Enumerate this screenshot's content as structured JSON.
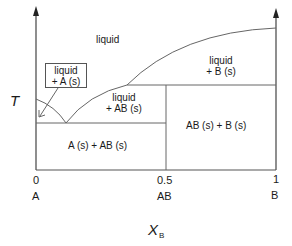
{
  "diagram": {
    "type": "binary phase diagram with congruently melting compound",
    "axes": {
      "y_label": "T",
      "x_label": "X",
      "x_label_sub": "B",
      "ticks": [
        {
          "value": "0",
          "name": "A"
        },
        {
          "value": "0.5",
          "name": "AB"
        },
        {
          "value": "1",
          "name": "B"
        }
      ]
    },
    "regions": {
      "liquid": "liquid",
      "liquid_A": [
        "liquid",
        "+ A (s)"
      ],
      "liquid_AB": [
        "liquid",
        "+ AB (s)"
      ],
      "liquid_B": [
        "liquid",
        "+ B (s)"
      ],
      "A_AB": "A (s) + AB (s)",
      "AB_B": "AB (s) + B (s)"
    },
    "colors": {
      "line": "#555555",
      "text": "#1a1a1a"
    }
  }
}
